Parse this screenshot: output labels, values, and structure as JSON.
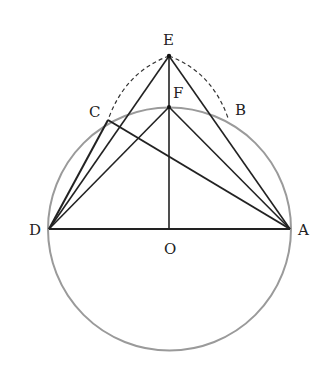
{
  "figure": {
    "type": "geometry-diagram",
    "circle": {
      "center": "O",
      "cx": 169.5,
      "cy": 229,
      "r": 121.5,
      "color": "#999999"
    },
    "points": {
      "E": {
        "label": "E",
        "x": 169,
        "y": 56
      },
      "F": {
        "label": "F",
        "x": 169,
        "y": 107
      },
      "C": {
        "label": "C",
        "x": 108,
        "y": 120
      },
      "B": {
        "label": "B",
        "x": 228,
        "y": 118
      },
      "D": {
        "label": "D",
        "x": 49,
        "y": 229
      },
      "A": {
        "label": "A",
        "x": 290,
        "y": 229
      },
      "O": {
        "label": "O",
        "x": 169.5,
        "y": 229
      }
    },
    "segments": [
      "DA",
      "EO",
      "ED",
      "EA",
      "FD",
      "FA",
      "CD",
      "CA"
    ],
    "dashed_arcs": [
      "EC",
      "EB"
    ],
    "line_color": "#222222"
  }
}
